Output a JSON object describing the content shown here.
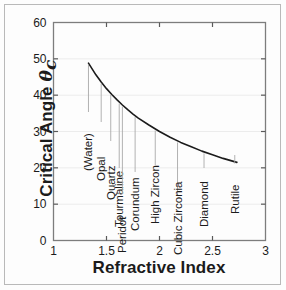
{
  "figure": {
    "background_color": "#fdfdfd",
    "border_color": "#b9b9b9",
    "curve_color": "#1b1b1b",
    "grid_color": "#ececec",
    "leader_color": "#a9a9a9"
  },
  "chart_data": {
    "type": "line",
    "title": "",
    "xlabel": "Refractive Index",
    "ylabel": "Critical Angle θc",
    "xlim": [
      1,
      3
    ],
    "ylim": [
      0,
      60
    ],
    "grid": true,
    "legend_position": "none",
    "xticks": [
      "1",
      "1.5",
      "2",
      "2.5",
      "3"
    ],
    "xtick_values": [
      1,
      1.5,
      2,
      2.5,
      3
    ],
    "yticks": [
      "0",
      "10",
      "20",
      "30",
      "40",
      "50",
      "60"
    ],
    "ytick_values": [
      0,
      10,
      20,
      30,
      40,
      50,
      60
    ],
    "series": [
      {
        "name": "Critical angle vs refractive index",
        "x": [
          1.33,
          1.4,
          1.45,
          1.5,
          1.55,
          1.6,
          1.65,
          1.7,
          1.75,
          1.8,
          1.9,
          2.0,
          2.1,
          2.2,
          2.3,
          2.4,
          2.5,
          2.6,
          2.73
        ],
        "y": [
          48.8,
          45.6,
          43.6,
          41.8,
          40.2,
          38.7,
          37.3,
          36.0,
          34.8,
          33.7,
          31.8,
          30.0,
          28.4,
          27.0,
          25.8,
          24.6,
          23.6,
          22.6,
          21.5
        ]
      }
    ],
    "annotations": [
      {
        "label": "(Water)",
        "x": 1.33,
        "y": 48.8
      },
      {
        "label": "Opal",
        "x": 1.45,
        "y": 43.6
      },
      {
        "label": "Quartz",
        "x": 1.54,
        "y": 40.5
      },
      {
        "label": "Tourmaline",
        "x": 1.62,
        "y": 38.1
      },
      {
        "label": "Peridot",
        "x": 1.65,
        "y": 37.3
      },
      {
        "label": "Corundum",
        "x": 1.77,
        "y": 34.4
      },
      {
        "label": "High Zircon",
        "x": 1.96,
        "y": 30.7
      },
      {
        "label": "Cubic Zirconia",
        "x": 2.17,
        "y": 27.4
      },
      {
        "label": "Diamond",
        "x": 2.42,
        "y": 24.4
      },
      {
        "label": "Rutile",
        "x": 2.71,
        "y": 21.6
      }
    ]
  },
  "axes": {
    "x_title": "Refractive Index",
    "y_title_main": "Critical Angle",
    "y_title_symbol": "θ",
    "y_title_subscript": "c"
  }
}
